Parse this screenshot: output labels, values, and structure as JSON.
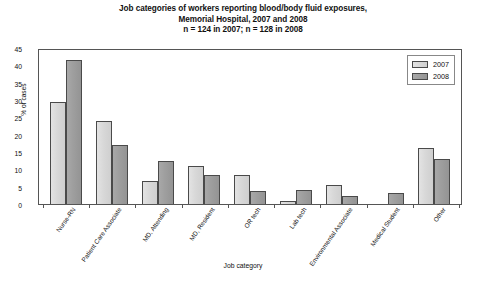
{
  "chart_data": {
    "type": "bar",
    "title": "Job categories of workers reporting blood/body fluid exposures,",
    "title_line2": "Memorial Hospital, 2007 and 2008",
    "title_line3": "n = 124 in 2007; n = 128 in 2008",
    "xlabel": "Job category",
    "ylabel": "% of cases",
    "ylim": [
      0,
      45
    ],
    "ytick_values": [
      0,
      5,
      10,
      15,
      20,
      25,
      30,
      35,
      40,
      45
    ],
    "ytick_labels": [
      "0",
      "5",
      "10",
      "15",
      "20",
      "25",
      "30",
      "35",
      "40",
      "45"
    ],
    "grid": false,
    "legend_position": "top-right",
    "categories": [
      "Nurse-RN",
      "Patient Care Associate",
      "MD, Attending",
      "MD, Resident",
      "OR tech",
      "Lab tech",
      "Environmental Associate",
      "Medical Student",
      "Other"
    ],
    "series": [
      {
        "name": "2007",
        "color": "#d8d8d8",
        "values": [
          29.5,
          24.0,
          6.5,
          11.0,
          8.3,
          0.9,
          5.5,
          0.0,
          16.3
        ]
      },
      {
        "name": "2008",
        "color": "#9e9e9e",
        "values": [
          41.5,
          17.0,
          12.3,
          8.5,
          3.8,
          3.9,
          2.3,
          3.2,
          13.0
        ]
      }
    ]
  }
}
